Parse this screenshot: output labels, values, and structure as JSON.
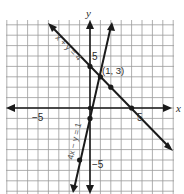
{
  "chart_data": {
    "type": "line",
    "title": "",
    "xlabel": "x",
    "ylabel": "y",
    "xlim": [
      -8,
      8
    ],
    "ylim": [
      -8,
      8.5
    ],
    "grid": true,
    "tick_labels": {
      "x": [
        {
          "value": -5,
          "label": "−5"
        },
        {
          "value": 5,
          "label": "5"
        }
      ],
      "y": [
        {
          "value": 5,
          "label": "5"
        },
        {
          "value": -5,
          "label": "−5"
        }
      ]
    },
    "series": [
      {
        "name": "x + y = 4",
        "equation": "x + y = 4",
        "slope": -1,
        "intercept": 4,
        "marked_points": [
          [
            0,
            4
          ],
          [
            1,
            3
          ],
          [
            2,
            2
          ],
          [
            4,
            0
          ]
        ]
      },
      {
        "name": "4x − y = 1",
        "equation": "4x − y = 1",
        "slope": 4,
        "intercept": -1,
        "marked_points": [
          [
            0,
            -1
          ],
          [
            1,
            3
          ],
          [
            -1,
            -5
          ]
        ]
      }
    ],
    "annotations": [
      {
        "text": "(1, 3)",
        "x": 1,
        "y": 3,
        "note": "intersection point"
      }
    ]
  },
  "labels": {
    "x_axis": "x",
    "y_axis": "y",
    "tick_neg5_x": "−5",
    "tick_pos5_x": "5",
    "tick_pos5_y": "5",
    "tick_neg5_y": "−5",
    "eq1": "x + y = 4",
    "eq2": "4x − y = 1",
    "intersection": "(1, 3)"
  }
}
